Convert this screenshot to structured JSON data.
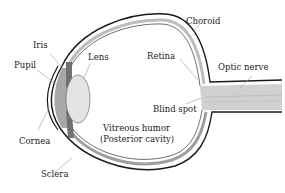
{
  "diagram": {
    "labels": {
      "iris": "Iris",
      "pupil": "Pupil",
      "lens": "Lens",
      "cornea": "Cornea",
      "sclera": "Sclera",
      "choroid": "Choroid",
      "retina": "Retina",
      "optic_nerve": "Optic nerve",
      "blind_spot": "Blind spot",
      "vitreous_humor_line1": "Vitreous humor",
      "vitreous_humor_line2": "(Posterior cavity)"
    },
    "colors": {
      "outline": "#1a1a1a",
      "iris": "#707070",
      "cornea_region": "#a8a8a8",
      "lens": "#e4e4e4",
      "choroid_band": "#bdbdbd",
      "optic_nerve": "#d0d0d0",
      "leader_line": "#9a9a9a",
      "text": "#222222"
    }
  }
}
